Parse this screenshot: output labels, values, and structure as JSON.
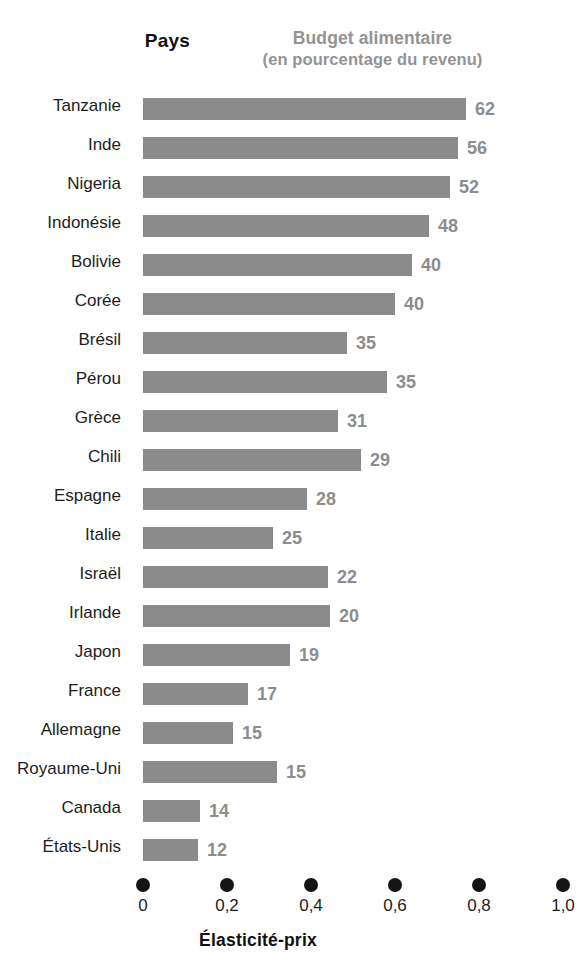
{
  "header": {
    "left_title": "Pays",
    "right_title_line1": "Budget alimentaire",
    "right_title_line2": "(en pourcentage du revenu)"
  },
  "axis": {
    "title": "Élasticité-prix",
    "tick_labels": [
      "0",
      "0,2",
      "0,4",
      "0,6",
      "0,8",
      "1,0"
    ],
    "tick_values": [
      0,
      0.2,
      0.4,
      0.6,
      0.8,
      1.0
    ]
  },
  "colors": {
    "bar": "#8b8b8b",
    "value_label": "#8d8d8d",
    "header_right": "#939393",
    "text": "#1d1d1d",
    "axis_dot": "#141414",
    "background": "#ffffff"
  },
  "chart_data": {
    "type": "bar",
    "orientation": "horizontal",
    "title": "Budget alimentaire (en pourcentage du revenu)",
    "xlabel": "Élasticité-prix",
    "ylabel": "Pays",
    "xlim": [
      0,
      1.0
    ],
    "grid": false,
    "legend": null,
    "note": "Bar length encodes élasticité-prix (bottom axis, 0 to 1,0); the bold grey number at the end of each bar is the budget alimentaire in percent of income.",
    "categories": [
      "Tanzanie",
      "Inde",
      "Nigeria",
      "Indonésie",
      "Bolivie",
      "Corée",
      "Brésil",
      "Pérou",
      "Grèce",
      "Chili",
      "Espagne",
      "Italie",
      "Israël",
      "Irlande",
      "Japon",
      "France",
      "Allemagne",
      "Royaume-Uni",
      "Canada",
      "États-Unis"
    ],
    "series": [
      {
        "name": "Élasticité-prix",
        "axis": "x-bottom",
        "values": [
          0.77,
          0.75,
          0.73,
          0.68,
          0.64,
          0.6,
          0.485,
          0.58,
          0.465,
          0.52,
          0.39,
          0.31,
          0.44,
          0.445,
          0.35,
          0.25,
          0.215,
          0.32,
          0.135,
          0.13
        ]
      },
      {
        "name": "Budget alimentaire (%)",
        "axis": "data-label",
        "values": [
          62,
          56,
          52,
          48,
          40,
          40,
          35,
          35,
          31,
          29,
          28,
          25,
          22,
          20,
          19,
          17,
          15,
          15,
          14,
          12
        ]
      }
    ],
    "value_labels": [
      "62",
      "56",
      "52",
      "48",
      "40",
      "40",
      "35",
      "35",
      "31",
      "29",
      "28",
      "25",
      "22",
      "20",
      "19",
      "17",
      "15",
      "15",
      "14",
      "12"
    ]
  }
}
